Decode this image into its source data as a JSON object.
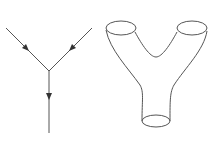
{
  "figure": {
    "panels": [
      {
        "name": "feynman-vertex",
        "description": "Two incoming lines with arrows merging into one outgoing line with arrow"
      },
      {
        "name": "pair-of-pants-surface",
        "description": "Y-shaped tube with two top openings and one bottom opening"
      }
    ],
    "colors": {
      "stroke": "#555555",
      "background": "#ffffff"
    }
  }
}
